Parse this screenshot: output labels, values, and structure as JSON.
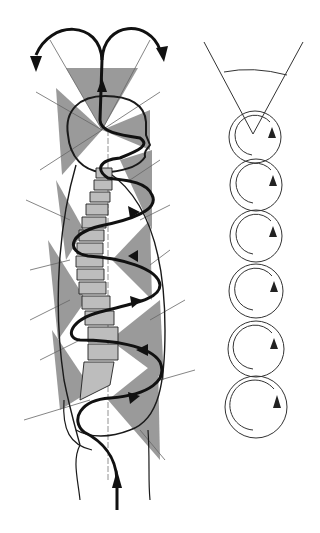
{
  "diagram": {
    "type": "anatomical-illustration",
    "colors": {
      "background": "#ffffff",
      "wedge_fill": "#9a9a9a",
      "line": "#1a1a1a",
      "thin_line": "#555555"
    },
    "left_figure": {
      "elements": [
        "head-outline",
        "spine-vertebrae",
        "torso-outline",
        "legs",
        "helical-arrow",
        "gray-wedges",
        "radial-lines",
        "center-vertical-dashed-line"
      ],
      "arrow_direction": "upward, spiraling, splitting into two at top"
    },
    "right_figure": {
      "elements": [
        "cone-angle",
        "rotation-circles"
      ],
      "circle_count": 6,
      "rotation_direction": "clockwise"
    }
  }
}
